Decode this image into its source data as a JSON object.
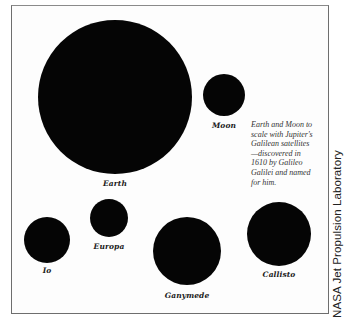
{
  "diagram": {
    "title": "Earth and Moon to scale with Jupiter's Galilean satellites",
    "bodies": [
      {
        "name": "Earth",
        "cx": 115,
        "cy": 97,
        "r": 77,
        "label_y": 179
      },
      {
        "name": "Moon",
        "cx": 224,
        "cy": 95,
        "r": 21,
        "label_y": 121
      },
      {
        "name": "Io",
        "cx": 47,
        "cy": 240,
        "r": 23,
        "label_y": 266
      },
      {
        "name": "Europa",
        "cx": 109,
        "cy": 218,
        "r": 19,
        "label_y": 242
      },
      {
        "name": "Ganymede",
        "cx": 187,
        "cy": 251,
        "r": 34,
        "label_y": 291
      },
      {
        "name": "Callisto",
        "cx": 279,
        "cy": 234,
        "r": 32,
        "label_y": 270
      }
    ],
    "caption_lines": [
      "Earth and Moon to",
      "scale with Jupiter's",
      "Galilean satellites",
      "—discovered in",
      "1610 by Galileo",
      "Galilei and named",
      "for him."
    ],
    "credit": "NASA Jet Propulsion Laboratory",
    "colors": {
      "body": "#050505",
      "frame": "#6e6e6e",
      "background": "#fdfdfd"
    }
  }
}
